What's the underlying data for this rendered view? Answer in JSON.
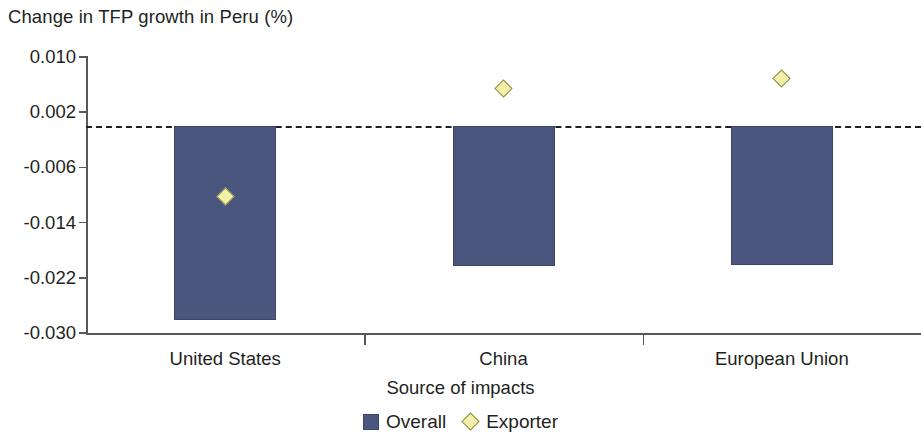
{
  "chart_data": {
    "type": "bar",
    "title": "Change in TFP growth in Peru (%)",
    "xlabel": "Source of impacts",
    "ylabel": "",
    "categories": [
      "United States",
      "China",
      "European Union"
    ],
    "ylim": [
      -0.03,
      0.01
    ],
    "yticks": [
      0.01,
      0.002,
      -0.006,
      -0.014,
      -0.022,
      -0.03
    ],
    "ytick_labels": [
      "0.010",
      "0.002",
      "-0.006",
      "-0.014",
      "-0.022",
      "-0.030"
    ],
    "grid": false,
    "zero_reference_line": 0.0,
    "legend_position": "bottom-center",
    "series": [
      {
        "name": "Overall",
        "type": "bar",
        "color": "#4a567e",
        "values": [
          -0.0281,
          -0.0203,
          -0.0202
        ]
      },
      {
        "name": "Exporter",
        "type": "scatter",
        "marker": "diamond",
        "color": "#f2efa8",
        "values": [
          -0.0102,
          0.0055,
          0.0069
        ]
      }
    ]
  },
  "legend": {
    "entries": [
      {
        "label": "Overall",
        "icon": "square-swatch",
        "color": "#4a567e"
      },
      {
        "label": "Exporter",
        "icon": "diamond-swatch",
        "color": "#f2efa8"
      }
    ]
  }
}
